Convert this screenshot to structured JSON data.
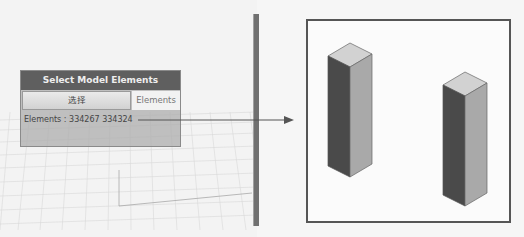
{
  "node": {
    "title": "Select Model Elements",
    "button_label": "选择",
    "output_port_label": "Elements",
    "output_text": "Elements : 334267 334324"
  },
  "preview": {
    "elements": [
      "334267",
      "334324"
    ],
    "object_type": "rectangular columns"
  },
  "colors": {
    "node_header": "#5f5f5f",
    "node_body": "#afafaf",
    "frame_border": "#555555"
  }
}
